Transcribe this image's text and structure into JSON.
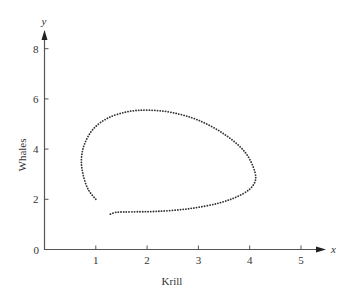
{
  "chart_data": {
    "type": "line",
    "title": "",
    "xlabel": "Krill",
    "ylabel": "Whales",
    "x_axis_var": "x",
    "y_axis_var": "y",
    "xlim": [
      0,
      5.5
    ],
    "ylim": [
      0,
      8.8
    ],
    "x_ticks": [
      "1",
      "2",
      "3",
      "4",
      "5"
    ],
    "y_ticks": [
      "0",
      "2",
      "4",
      "6",
      "8"
    ],
    "origin_label": "0",
    "grid": false,
    "legend": null,
    "series": [
      {
        "name": "trajectory",
        "style": "dotted",
        "color": "#333333",
        "x": [
          1.0,
          0.85,
          0.75,
          0.72,
          0.78,
          0.95,
          1.25,
          1.65,
          2.05,
          2.5,
          3.0,
          3.5,
          3.9,
          4.1,
          4.08,
          3.85,
          3.4,
          2.8,
          2.2,
          1.7,
          1.4,
          1.25
        ],
        "y": [
          2.0,
          2.4,
          3.0,
          3.6,
          4.2,
          4.8,
          5.25,
          5.5,
          5.55,
          5.45,
          5.15,
          4.6,
          3.9,
          3.1,
          2.6,
          2.2,
          1.85,
          1.62,
          1.52,
          1.5,
          1.48,
          1.38
        ]
      }
    ]
  }
}
